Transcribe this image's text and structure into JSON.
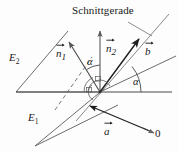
{
  "figure": {
    "title": "Schnittgerade",
    "background_color": "#fdfdfd",
    "ink_color": "#1a1a1a",
    "planes": [
      {
        "id": "E2",
        "label": "E",
        "subscript": "2"
      },
      {
        "id": "E1",
        "label": "E",
        "subscript": "1"
      }
    ],
    "vectors": [
      {
        "id": "n1",
        "label": "n",
        "subscript": "1",
        "accent": "arrow"
      },
      {
        "id": "n2",
        "label": "n",
        "subscript": "2",
        "accent": "arrow"
      },
      {
        "id": "b",
        "label": "b",
        "subscript": "",
        "accent": "arrow"
      },
      {
        "id": "a",
        "label": "a",
        "subscript": "",
        "accent": "arrow"
      }
    ],
    "angles": [
      {
        "id": "alpha-normals",
        "label": "α"
      },
      {
        "id": "alpha-planes",
        "label": "α"
      }
    ],
    "origin": {
      "label": "0"
    }
  }
}
